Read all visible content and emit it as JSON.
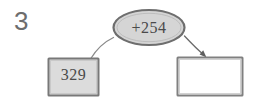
{
  "problem": {
    "number": "3"
  },
  "diagram": {
    "type": "function-machine",
    "input_box": {
      "label": "329",
      "fill": "#dcdcdc",
      "border": "#787878"
    },
    "operation_node": {
      "label": "+254",
      "shape": "ellipse",
      "fill": "#d5d5d5",
      "border": "#6e6e6e"
    },
    "output_box": {
      "label": "",
      "fill": "#ffffff",
      "border": "#808080"
    },
    "connectors": [
      {
        "name": "input-to-operation",
        "from": "input_box",
        "to": "operation_node",
        "arrowhead": false,
        "color": "#8a8a8a"
      },
      {
        "name": "operation-to-output",
        "from": "operation_node",
        "to": "output_box",
        "arrowhead": true,
        "color": "#6b6b6b"
      }
    ]
  },
  "colors": {
    "background": "#ffffff",
    "text": "#4a4a4a",
    "problem_number": "#6d6d6d"
  }
}
